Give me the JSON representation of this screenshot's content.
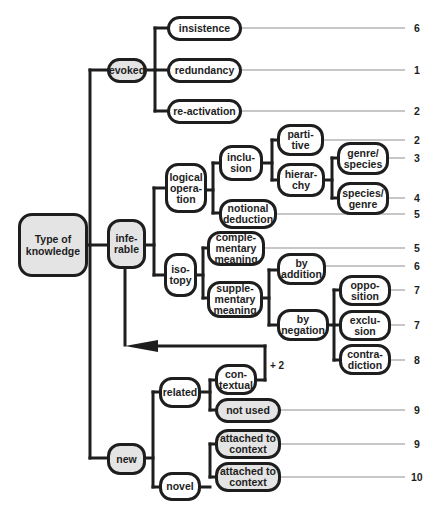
{
  "diagram": {
    "root": {
      "label": "Type of\nknowledge"
    },
    "nodes": {
      "evoked": "evoked",
      "insistence": "insistence",
      "redundancy": "redundancy",
      "reactivation": "re-activation",
      "inferable": "infe-\nrable",
      "logical_operation": "logical\nopera-\ntion",
      "inclusion": "inclu-\nsion",
      "partitive": "parti-\ntive",
      "hierarchy": "hierar-\nchy",
      "genre_species": "genre/\nspecies",
      "species_genre": "species/\ngenre",
      "notional_deduction": "notional\ndeduction",
      "isotopy": "iso-\ntopy",
      "complementary_meaning": "comple-\nmentary\nmeaning",
      "supplementary_meaning": "supple-\nmentary\nmeaning",
      "by_addition": "by\naddition",
      "by_negation": "by\nnegation",
      "opposition": "oppo-\nsition",
      "exclusion": "exclu-\nsion",
      "contradiction": "contra-\ndiction",
      "new": "new",
      "related": "related",
      "contextual": "con-\ntextual",
      "not_used": "not used",
      "novel": "novel",
      "attached_to_context_1": "attached to\ncontext",
      "attached_to_context_2": "attached to\ncontext"
    },
    "counts": {
      "insistence": "6",
      "redundancy": "1",
      "reactivation": "2",
      "partitive": "2",
      "genre_species": "3",
      "species_genre": "4",
      "notional_deduction": "5",
      "complementary_meaning": "5",
      "by_addition": "6",
      "opposition": "7",
      "exclusion": "7",
      "contradiction": "8",
      "not_used": "9",
      "attached_to_context_1": "9",
      "attached_to_context_2": "10"
    },
    "feedback_label": "+ 2",
    "colors": {
      "stroke": "#1e1e1e",
      "shaded_fill": "#e4e4e4",
      "leader_line": "#b4b4b4"
    }
  }
}
